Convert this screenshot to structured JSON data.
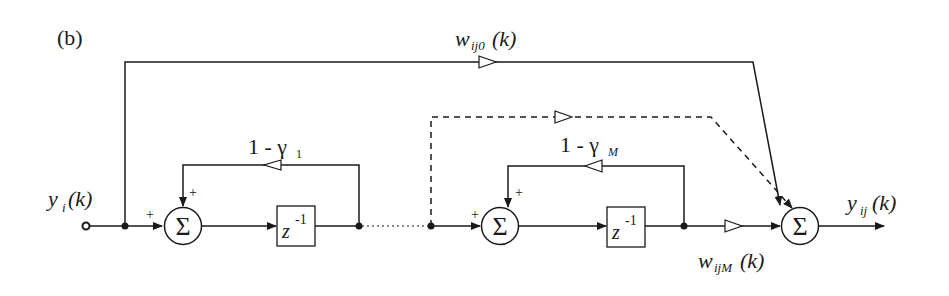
{
  "figure": {
    "panel_label": "(b)",
    "input_label": {
      "main": "y",
      "sub": "i",
      "arg": "(k)"
    },
    "output_label": {
      "main": "y",
      "sub": "ij",
      "arg": "(k)"
    },
    "top_weight_label": {
      "main": "w",
      "sub": "ij0",
      "arg": "(k)"
    },
    "bottom_weight_label": {
      "main": "w",
      "sub": "ijM",
      "arg": "(k)"
    },
    "feedback_1_label": {
      "main": "1 - γ",
      "sub": "1"
    },
    "feedback_M_label": {
      "main": "1 - γ",
      "sub": "M"
    },
    "sum_symbol": "Σ",
    "delay_label": {
      "main": "z",
      "sup": "-1"
    },
    "plus_sign": "+"
  }
}
